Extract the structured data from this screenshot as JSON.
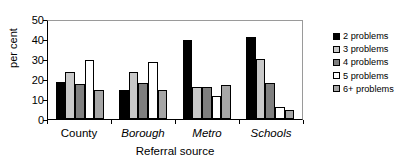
{
  "chart_data": {
    "type": "bar",
    "title": "",
    "xlabel": "Referral source",
    "ylabel": "per cent",
    "categories": [
      "County",
      "Borough",
      "Metro",
      "Schools"
    ],
    "category_styles": [
      "normal",
      "italic",
      "italic",
      "italic"
    ],
    "series": [
      {
        "name": "2 problems",
        "color": "#000000",
        "values": [
          19,
          15,
          40.5,
          42
        ]
      },
      {
        "name": "3 problems",
        "color": "#c9c9c9",
        "values": [
          24,
          24,
          16.5,
          30.5
        ]
      },
      {
        "name": "4 problems",
        "color": "#7f7f7f",
        "values": [
          18,
          18.5,
          16.5,
          18.5
        ]
      },
      {
        "name": "5 problems",
        "color": "#ffffff",
        "values": [
          30,
          29,
          11.5,
          6
        ]
      },
      {
        "name": "6+ problems",
        "color": "#a6a6a6",
        "values": [
          15,
          15,
          17.5,
          4.5
        ]
      }
    ],
    "ylim": [
      0,
      50
    ],
    "yticks": [
      0,
      10,
      20,
      30,
      40,
      50
    ],
    "grid": false,
    "legend_position": "right"
  },
  "legend": {
    "items": [
      {
        "label": "2 problems"
      },
      {
        "label": "3 problems"
      },
      {
        "label": "4 problems"
      },
      {
        "label": "5 problems"
      },
      {
        "label": "6+ problems"
      }
    ]
  }
}
